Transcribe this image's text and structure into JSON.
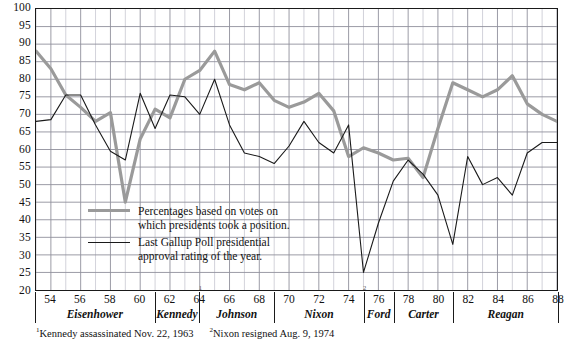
{
  "chart_data": {
    "type": "line",
    "title": "",
    "xlabel": "",
    "ylabel": "",
    "xlim": [
      53,
      88
    ],
    "ylim": [
      20,
      100
    ],
    "ytick_step": 5,
    "grid": true,
    "yticks": [
      20,
      25,
      30,
      35,
      40,
      45,
      50,
      55,
      60,
      65,
      70,
      75,
      80,
      85,
      90,
      95,
      100
    ],
    "xticks": [
      54,
      56,
      58,
      60,
      62,
      64,
      66,
      68,
      70,
      72,
      74,
      76,
      78,
      80,
      82,
      84,
      86,
      88
    ],
    "x": [
      53,
      54,
      55,
      56,
      57,
      58,
      59,
      60,
      61,
      62,
      63,
      64,
      65,
      66,
      67,
      68,
      69,
      70,
      71,
      72,
      73,
      74,
      75,
      76,
      77,
      78,
      79,
      80,
      81,
      82,
      83,
      84,
      85,
      86,
      87,
      88
    ],
    "series": [
      {
        "name": "Percentages based on votes on which presidents took a position.",
        "color": "#9a9a9a",
        "width": 3.2,
        "values": [
          88,
          83,
          79,
          75,
          72,
          68,
          70,
          65,
          45,
          65,
          73,
          80,
          83,
          88,
          79,
          78,
          79,
          74,
          72,
          73,
          76,
          71,
          62,
          58,
          60,
          59,
          56,
          55,
          53,
          52,
          50,
          47,
          47,
          45,
          43,
          44
        ]
      },
      {
        "name": "Last Gallup Poll presidential approval rating of the year.",
        "color": "#1a1a1a",
        "width": 1.1,
        "values": [
          68,
          68,
          69,
          75,
          75,
          75,
          63,
          58,
          60,
          57,
          72,
          62,
          59,
          77,
          65,
          58,
          76,
          76,
          76,
          67,
          48,
          49,
          46,
          49,
          54,
          57,
          51,
          50,
          57,
          58,
          56,
          52,
          57,
          57,
          53,
          54
        ]
      }
    ],
    "series_display": [
      {
        "id": "votes-line",
        "color": "#9a9a9a",
        "width": 3.2,
        "points": [
          [
            53,
            88
          ],
          [
            54,
            83
          ],
          [
            55,
            75.5
          ],
          [
            56,
            72
          ],
          [
            57,
            68
          ],
          [
            58,
            70.5
          ],
          [
            59,
            45
          ],
          [
            60,
            63
          ],
          [
            61,
            71.5
          ],
          [
            62,
            69
          ],
          [
            63,
            80
          ],
          [
            64,
            82.5
          ],
          [
            65,
            88
          ],
          [
            66,
            78.5
          ],
          [
            67,
            77
          ],
          [
            68,
            79
          ],
          [
            69,
            74
          ],
          [
            70,
            72
          ],
          [
            71,
            73.5
          ],
          [
            72,
            76
          ],
          [
            73,
            71
          ],
          [
            74,
            58
          ],
          [
            75,
            60.5
          ],
          [
            76,
            59
          ],
          [
            77,
            57
          ],
          [
            78,
            57.5
          ],
          [
            79,
            52
          ],
          [
            80,
            66
          ],
          [
            81,
            79
          ],
          [
            82,
            77
          ],
          [
            83,
            75
          ],
          [
            84,
            77
          ],
          [
            85,
            81
          ],
          [
            86,
            73
          ],
          [
            87,
            70
          ],
          [
            88,
            68
          ]
        ]
      },
      {
        "id": "gallup-line",
        "color": "#1a1a1a",
        "width": 1.1,
        "points": [
          [
            53,
            68
          ],
          [
            54,
            68.5
          ],
          [
            55,
            75.5
          ],
          [
            56,
            75.5
          ],
          [
            57,
            67
          ],
          [
            58,
            59.5
          ],
          [
            59,
            57
          ],
          [
            60,
            76
          ],
          [
            61,
            66
          ],
          [
            62,
            75.5
          ],
          [
            63,
            75
          ],
          [
            64,
            70
          ],
          [
            65,
            80
          ],
          [
            66,
            67
          ],
          [
            67,
            59
          ],
          [
            68,
            58
          ],
          [
            69,
            56
          ],
          [
            70,
            61
          ],
          [
            71,
            68
          ],
          [
            72,
            62
          ],
          [
            73,
            59
          ],
          [
            74,
            67
          ],
          [
            75,
            25
          ],
          [
            76,
            39
          ],
          [
            77,
            51
          ],
          [
            78,
            57
          ],
          [
            79,
            53
          ],
          [
            80,
            47
          ],
          [
            81,
            33
          ],
          [
            82,
            58
          ],
          [
            83,
            50
          ],
          [
            84,
            52
          ],
          [
            85,
            47
          ],
          [
            86,
            59
          ],
          [
            87,
            62
          ],
          [
            88,
            62
          ]
        ]
      }
    ],
    "presidents": [
      {
        "name": "Eisenhower",
        "start": 53,
        "end": 61
      },
      {
        "name": "Kennedy",
        "start": 61,
        "end": 64
      },
      {
        "name": "Johnson",
        "start": 64,
        "end": 69
      },
      {
        "name": "Nixon",
        "start": 69,
        "end": 75
      },
      {
        "name": "Ford",
        "start": 75,
        "end": 77
      },
      {
        "name": "Carter",
        "start": 77,
        "end": 81
      },
      {
        "name": "Reagan",
        "start": 81,
        "end": 88
      }
    ],
    "annotations": [
      {
        "marker": "1",
        "x": 64
      },
      {
        "marker": "2",
        "x": 75
      }
    ]
  },
  "legend": {
    "items": [
      {
        "id": "votes",
        "line1": "Percentages based on votes on",
        "line2": "which presidents took a position.",
        "swatch": "thick"
      },
      {
        "id": "gallup",
        "line1": "Last Gallup Poll presidential",
        "line2": "approval rating of the year.",
        "swatch": "thin"
      }
    ]
  },
  "footnotes": [
    {
      "marker": "1",
      "text": "Kennedy assassinated Nov. 22, 1963"
    },
    {
      "marker": "2",
      "text": "Nixon resigned Aug. 9, 1974"
    }
  ]
}
